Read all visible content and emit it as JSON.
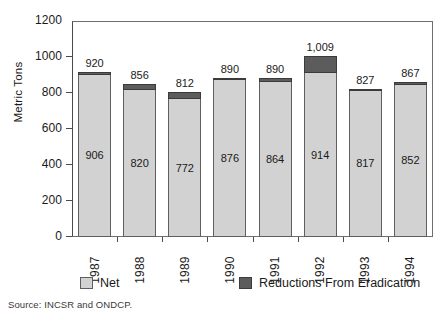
{
  "chart_data": {
    "type": "bar",
    "title": "",
    "subtitle": "",
    "xlabel": "",
    "ylabel": "Metric Tons",
    "categories": [
      "1987",
      "1988",
      "1989",
      "1990",
      "1991",
      "1992",
      "1993",
      "1994"
    ],
    "totals": [
      "920",
      "856",
      "812",
      "890",
      "890",
      "1,009",
      "827",
      "867"
    ],
    "totals_numeric": [
      920,
      856,
      812,
      890,
      890,
      1009,
      827,
      867
    ],
    "series": [
      {
        "name": "Net",
        "color": "#d2d2d2",
        "values": [
          906,
          820,
          772,
          876,
          864,
          914,
          817,
          852
        ],
        "labels": [
          "906",
          "820",
          "772",
          "876",
          "864",
          "914",
          "817",
          "852"
        ]
      },
      {
        "name": "Reductions From Eradication",
        "color": "#5c5c5c",
        "values": [
          14,
          36,
          40,
          14,
          26,
          95,
          10,
          15
        ],
        "labels": [
          "",
          "",
          "",
          "",
          "",
          "",
          "",
          ""
        ]
      }
    ],
    "stacked": true,
    "ylim": [
      0,
      1200
    ],
    "yticks": [
      0,
      200,
      400,
      600,
      800,
      1000,
      1200
    ],
    "ytick_labels": [
      "0",
      "200",
      "400",
      "600",
      "800",
      "1000",
      "1200"
    ],
    "grid": false,
    "legend_position": "bottom"
  },
  "legend": {
    "items": [
      {
        "label": "Net",
        "swatch": "net-swatch"
      },
      {
        "label": "Reductions From Eradication",
        "swatch": "eradication-swatch"
      }
    ]
  },
  "footer": {
    "source": "Source: INCSR and ONDCP."
  }
}
